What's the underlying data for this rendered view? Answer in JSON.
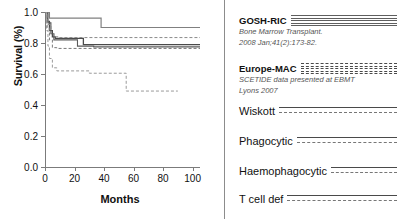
{
  "chart_data": {
    "type": "line",
    "subtype": "kaplan-meier-step",
    "title": "",
    "xlabel": "Months",
    "ylabel": "Survival (%)",
    "xlim": [
      0,
      105
    ],
    "ylim": [
      0.0,
      1.0
    ],
    "xticks": [
      0,
      20,
      40,
      60,
      80,
      100
    ],
    "xtick_labels": [
      "0",
      "20",
      "40",
      "60",
      "80",
      "100"
    ],
    "yticks": [
      0.0,
      0.2,
      0.4,
      0.6,
      0.8,
      1.0
    ],
    "ytick_labels": [
      "0.0",
      "0.2",
      "0.4",
      "0.6",
      "0.8",
      "1.0"
    ],
    "grid": false,
    "legend_position": "right",
    "series": [
      {
        "name": "GOSH-RIC",
        "style": "solid",
        "color": "#808080",
        "width": 1.2,
        "points": [
          [
            0,
            1.0
          ],
          [
            2,
            1.0
          ],
          [
            3,
            0.96
          ],
          [
            38,
            0.96
          ],
          [
            38,
            0.9
          ],
          [
            105,
            0.9
          ]
        ]
      },
      {
        "name": "Wiskott",
        "style": "solid",
        "color": "#4a4a4a",
        "width": 1.3,
        "points": [
          [
            0,
            1.0
          ],
          [
            1.5,
            0.94
          ],
          [
            3,
            0.88
          ],
          [
            5,
            0.84
          ],
          [
            7,
            0.83
          ],
          [
            26,
            0.83
          ],
          [
            26,
            0.79
          ],
          [
            105,
            0.79
          ]
        ]
      },
      {
        "name": "Phagocytic",
        "style": "solid",
        "color": "#5a5a5a",
        "width": 1.1,
        "points": [
          [
            0,
            1.0
          ],
          [
            2,
            0.93
          ],
          [
            4,
            0.86
          ],
          [
            6,
            0.82
          ],
          [
            8,
            0.82
          ],
          [
            22,
            0.82
          ],
          [
            22,
            0.78
          ],
          [
            33,
            0.78
          ],
          [
            33,
            0.775
          ],
          [
            105,
            0.775
          ]
        ]
      },
      {
        "name": "Haemophagocytic",
        "style": "dashed",
        "color": "#8a8a8a",
        "width": 1.0,
        "points": [
          [
            0,
            1.0
          ],
          [
            2,
            0.92
          ],
          [
            4,
            0.86
          ],
          [
            6,
            0.84
          ],
          [
            9,
            0.835
          ],
          [
            105,
            0.835
          ]
        ]
      },
      {
        "name": "T cell def",
        "style": "dashed",
        "color": "#7a7a7a",
        "width": 1.0,
        "points": [
          [
            0,
            1.0
          ],
          [
            1.5,
            0.9
          ],
          [
            3,
            0.82
          ],
          [
            5,
            0.77
          ],
          [
            8,
            0.765
          ],
          [
            105,
            0.765
          ]
        ]
      },
      {
        "name": "Europe-MAC",
        "style": "dashed",
        "color": "#9a9a9a",
        "width": 1.0,
        "points": [
          [
            0,
            1.0
          ],
          [
            1,
            0.88
          ],
          [
            2,
            0.78
          ],
          [
            3,
            0.7
          ],
          [
            5,
            0.64
          ],
          [
            8,
            0.62
          ],
          [
            30,
            0.62
          ],
          [
            30,
            0.605
          ],
          [
            55,
            0.605
          ],
          [
            55,
            0.49
          ],
          [
            90,
            0.49
          ]
        ]
      }
    ]
  },
  "axes": {
    "y_title": "Survival (%)",
    "x_title": "Months"
  },
  "legend": {
    "entries": [
      {
        "label": "GOSH-RIC",
        "bold": true,
        "marker": "solid-stack",
        "citation_line1": "Bone Marrow Transplant.",
        "citation_line2": "2008 Jan;41(2):173-82."
      },
      {
        "label": "Europe-MAC",
        "bold": true,
        "marker": "dash-stack",
        "citation_line1": "SCETIDE  data presented at  EBMT",
        "citation_line2": "Lyons 2007"
      },
      {
        "label": "Wiskott",
        "bold": false,
        "marker": "solid-dashed-pair",
        "citation_line1": "",
        "citation_line2": ""
      },
      {
        "label": "Phagocytic",
        "bold": false,
        "marker": "solid-dashed-pair",
        "citation_line1": "",
        "citation_line2": ""
      },
      {
        "label": "Haemophagocytic",
        "bold": false,
        "marker": "solid-dashed-pair",
        "citation_line1": "",
        "citation_line2": ""
      },
      {
        "label": "T cell def",
        "bold": false,
        "marker": "solid-dashed-pair",
        "citation_line1": "",
        "citation_line2": ""
      }
    ]
  },
  "colors": {
    "axis": "#7b7b7b",
    "curve_dark": "#4a4a4a",
    "curve_mid": "#7a7a7a",
    "curve_light": "#9a9a9a",
    "text": "#111111",
    "citation": "#555555",
    "divider": "#8c8c8c"
  }
}
